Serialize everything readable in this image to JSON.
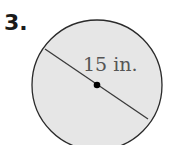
{
  "problem": {
    "number": "3."
  },
  "diagram": {
    "shape": "circle",
    "label": "15 in.",
    "measure": "diameter",
    "value": 15,
    "unit": "in.",
    "fill_color": "#e6e6e6",
    "stroke_color": "#2a2a2a"
  }
}
